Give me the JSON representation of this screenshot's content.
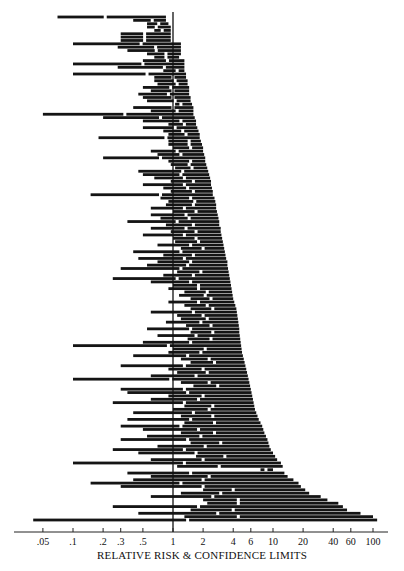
{
  "chart_data": {
    "type": "forest",
    "title": "",
    "xlabel": "RELATIVE RISK & CONFIDENCE LIMITS",
    "ylabel": "",
    "x_scale": "log",
    "xlim": [
      0.04,
      120
    ],
    "reference_line": 1,
    "grid": false,
    "legend": null,
    "x_ticks": [
      {
        "value": 0.05,
        "label": ".05"
      },
      {
        "value": 0.1,
        "label": ".1"
      },
      {
        "value": 0.2,
        "label": ".2"
      },
      {
        "value": 0.3,
        "label": ".3"
      },
      {
        "value": 0.5,
        "label": ".5"
      },
      {
        "value": 1,
        "label": "1"
      },
      {
        "value": 2,
        "label": "2"
      },
      {
        "value": 4,
        "label": "4"
      },
      {
        "value": 6,
        "label": "6"
      },
      {
        "value": 10,
        "label": "10"
      },
      {
        "value": 20,
        "label": "20"
      },
      {
        "value": 40,
        "label": "40"
      },
      {
        "value": 60,
        "label": "60"
      },
      {
        "value": 100,
        "label": "100"
      }
    ],
    "rows": [
      [
        0.07,
        0.21,
        0.85
      ],
      [
        0.4,
        0.62,
        0.85
      ],
      [
        0.55,
        0.72,
        0.9
      ],
      [
        0.55,
        0.68,
        0.95
      ],
      [
        0.65,
        0.78,
        0.95
      ],
      [
        0.3,
        0.52,
        0.95
      ],
      [
        0.3,
        0.52,
        0.95
      ],
      [
        0.3,
        0.52,
        0.95
      ],
      [
        0.1,
        0.48,
        1.2
      ],
      [
        0.28,
        0.67,
        1.2
      ],
      [
        0.35,
        0.68,
        1.2
      ],
      [
        0.55,
        0.85,
        1.2
      ],
      [
        0.65,
        0.85,
        1.15
      ],
      [
        0.5,
        0.88,
        1.3
      ],
      [
        0.1,
        0.5,
        1.3
      ],
      [
        0.28,
        0.82,
        1.3
      ],
      [
        0.8,
        1.1,
        1.3
      ],
      [
        0.1,
        0.55,
        1.35
      ],
      [
        0.65,
        1.0,
        1.35
      ],
      [
        0.65,
        1.05,
        1.4
      ],
      [
        0.7,
        1.1,
        1.4
      ],
      [
        0.5,
        0.95,
        1.45
      ],
      [
        0.6,
        1.0,
        1.45
      ],
      [
        0.45,
        0.9,
        1.45
      ],
      [
        0.5,
        1.0,
        1.5
      ],
      [
        0.55,
        1.05,
        1.5
      ],
      [
        1.05,
        1.2,
        1.55
      ],
      [
        0.4,
        1.0,
        1.6
      ],
      [
        0.6,
        1.1,
        1.6
      ],
      [
        0.05,
        0.33,
        1.6
      ],
      [
        0.2,
        0.75,
        1.65
      ],
      [
        0.5,
        1.2,
        1.7
      ],
      [
        0.9,
        1.3,
        1.7
      ],
      [
        0.5,
        1.05,
        1.75
      ],
      [
        0.8,
        1.25,
        1.8
      ],
      [
        0.9,
        1.35,
        1.85
      ],
      [
        0.18,
        0.85,
        1.85
      ],
      [
        0.9,
        1.45,
        1.9
      ],
      [
        0.9,
        1.45,
        1.95
      ],
      [
        1.0,
        1.5,
        2.0
      ],
      [
        0.6,
        1.1,
        2.0
      ],
      [
        0.7,
        1.2,
        2.05
      ],
      [
        0.2,
        0.75,
        2.1
      ],
      [
        0.9,
        1.5,
        2.1
      ],
      [
        0.95,
        1.45,
        2.15
      ],
      [
        1.05,
        1.55,
        2.2
      ],
      [
        0.45,
        1.25,
        2.25
      ],
      [
        0.5,
        1.2,
        2.3
      ],
      [
        0.65,
        1.3,
        2.35
      ],
      [
        0.95,
        1.6,
        2.4
      ],
      [
        0.5,
        1.3,
        2.4
      ],
      [
        0.8,
        1.4,
        2.45
      ],
      [
        0.95,
        1.6,
        2.5
      ],
      [
        0.15,
        0.75,
        2.5
      ],
      [
        0.75,
        1.5,
        2.6
      ],
      [
        0.9,
        1.65,
        2.65
      ],
      [
        0.85,
        1.6,
        2.7
      ],
      [
        0.6,
        1.3,
        2.7
      ],
      [
        1.0,
        1.7,
        2.75
      ],
      [
        0.6,
        1.35,
        2.8
      ],
      [
        0.75,
        1.45,
        2.85
      ],
      [
        0.35,
        1.1,
        2.9
      ],
      [
        0.85,
        1.6,
        2.9
      ],
      [
        0.6,
        1.35,
        3.0
      ],
      [
        0.95,
        1.7,
        3.0
      ],
      [
        0.5,
        1.3,
        3.05
      ],
      [
        1.0,
        1.7,
        3.1
      ],
      [
        1.05,
        1.8,
        3.15
      ],
      [
        0.7,
        1.5,
        3.2
      ],
      [
        1.2,
        2.0,
        3.25
      ],
      [
        0.4,
        1.2,
        3.3
      ],
      [
        0.8,
        1.6,
        3.35
      ],
      [
        0.45,
        1.3,
        3.4
      ],
      [
        0.7,
        1.5,
        3.5
      ],
      [
        0.55,
        1.4,
        3.5
      ],
      [
        0.3,
        1.2,
        3.55
      ],
      [
        1.1,
        1.9,
        3.6
      ],
      [
        0.8,
        1.6,
        3.65
      ],
      [
        0.25,
        1.1,
        3.7
      ],
      [
        0.6,
        1.5,
        3.75
      ],
      [
        1.0,
        1.8,
        3.8
      ],
      [
        0.9,
        1.8,
        3.85
      ],
      [
        1.3,
        2.2,
        3.9
      ],
      [
        1.15,
        2.1,
        3.95
      ],
      [
        1.5,
        2.4,
        4.0
      ],
      [
        0.9,
        1.8,
        4.1
      ],
      [
        1.3,
        2.2,
        4.2
      ],
      [
        1.5,
        2.5,
        4.3
      ],
      [
        0.6,
        1.6,
        4.35
      ],
      [
        1.1,
        2.0,
        4.4
      ],
      [
        1.2,
        2.2,
        4.45
      ],
      [
        0.85,
        1.9,
        4.5
      ],
      [
        1.35,
        2.4,
        4.55
      ],
      [
        0.55,
        1.5,
        4.6
      ],
      [
        1.5,
        2.5,
        4.6
      ],
      [
        0.7,
        1.7,
        4.65
      ],
      [
        1.4,
        2.4,
        4.7
      ],
      [
        0.5,
        1.5,
        4.75
      ],
      [
        0.1,
        0.9,
        4.8
      ],
      [
        1.0,
        2.1,
        4.85
      ],
      [
        0.9,
        1.9,
        4.9
      ],
      [
        0.4,
        1.4,
        5.0
      ],
      [
        1.2,
        2.3,
        5.1
      ],
      [
        1.5,
        2.6,
        5.2
      ],
      [
        0.3,
        1.3,
        5.3
      ],
      [
        0.9,
        2.0,
        5.4
      ],
      [
        1.1,
        2.2,
        5.5
      ],
      [
        0.6,
        1.7,
        5.6
      ],
      [
        0.1,
        0.95,
        5.7
      ],
      [
        1.2,
        2.3,
        5.8
      ],
      [
        1.6,
        2.8,
        5.9
      ],
      [
        0.3,
        1.3,
        6.0
      ],
      [
        0.35,
        1.4,
        6.1
      ],
      [
        0.9,
        2.0,
        6.2
      ],
      [
        0.6,
        1.8,
        6.3
      ],
      [
        0.25,
        1.3,
        6.4
      ],
      [
        1.3,
        2.5,
        6.5
      ],
      [
        1.0,
        2.3,
        6.6
      ],
      [
        0.4,
        1.6,
        6.8
      ],
      [
        1.2,
        2.5,
        7.0
      ],
      [
        0.35,
        1.5,
        7.2
      ],
      [
        1.3,
        2.6,
        7.5
      ],
      [
        0.3,
        1.2,
        7.8
      ],
      [
        0.5,
        1.8,
        8.0
      ],
      [
        1.2,
        2.6,
        8.2
      ],
      [
        0.55,
        1.9,
        8.5
      ],
      [
        0.3,
        1.4,
        8.8
      ],
      [
        1.5,
        3.0,
        9.0
      ],
      [
        0.7,
        2.1,
        9.2
      ],
      [
        0.25,
        1.3,
        9.5
      ],
      [
        0.45,
        1.7,
        10
      ],
      [
        1.7,
        3.3,
        10.5
      ],
      [
        0.6,
        2.0,
        11
      ],
      [
        0.1,
        1.3,
        12
      ],
      [
        1.1,
        2.9,
        12.5
      ],
      [
        7.5,
        8.5,
        10
      ],
      [
        0.35,
        1.5,
        13
      ],
      [
        0.6,
        2.3,
        14
      ],
      [
        0.4,
        2.0,
        16
      ],
      [
        0.15,
        1.2,
        18
      ],
      [
        0.3,
        2.0,
        19
      ],
      [
        2.0,
        4.0,
        21
      ],
      [
        1.2,
        3.0,
        23
      ],
      [
        0.6,
        2.5,
        30
      ],
      [
        2.0,
        4.5,
        35
      ],
      [
        2.2,
        4.5,
        45
      ],
      [
        0.25,
        1.8,
        50
      ],
      [
        1.5,
        4.0,
        55
      ],
      [
        0.45,
        2.8,
        75
      ],
      [
        1.3,
        4.5,
        100
      ],
      [
        0.04,
        1.4,
        110
      ]
    ]
  },
  "axis": {
    "label": "RELATIVE RISK & CONFIDENCE LIMITS"
  }
}
